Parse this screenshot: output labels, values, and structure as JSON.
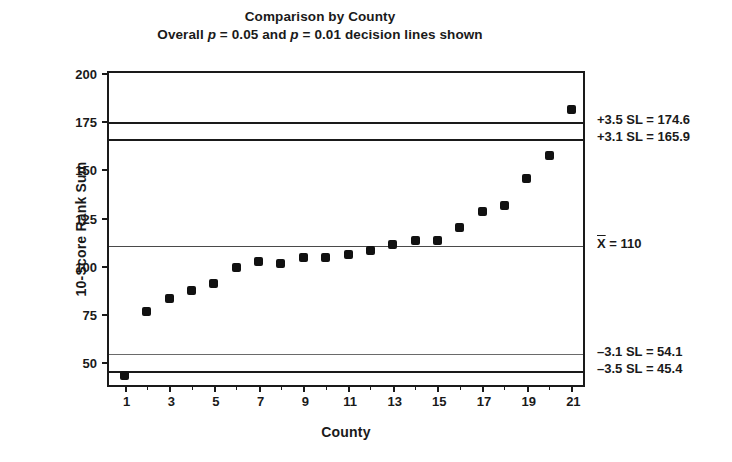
{
  "chart_data": {
    "type": "scatter",
    "title": "Comparison by County",
    "subtitle_parts": {
      "pre": "Overall ",
      "p1": "p",
      "mid1": " = 0.05 and ",
      "p2": "p",
      "mid2": " = 0.01 decision lines shown"
    },
    "subtitle": "Overall p = 0.05 and p = 0.01 decision lines shown",
    "xlabel": "County",
    "ylabel": "10-Score Rank Sum",
    "xlim": [
      0.3,
      21.7
    ],
    "ylim": [
      36,
      200
    ],
    "ylim_ticks": [
      50,
      75,
      100,
      125,
      150,
      175,
      200
    ],
    "ytick_labels": [
      "50",
      "75",
      "100",
      "125",
      "150",
      "175",
      "200"
    ],
    "xticks": [
      1,
      3,
      5,
      7,
      9,
      11,
      13,
      15,
      17,
      19,
      21
    ],
    "xtick_labels": [
      "1",
      "3",
      "5",
      "7",
      "9",
      "11",
      "13",
      "15",
      "17",
      "19",
      "21"
    ],
    "xticks_minor": [
      2,
      4,
      6,
      8,
      10,
      12,
      14,
      16,
      18,
      20
    ],
    "grid": false,
    "legend": "none",
    "marker_color": "#111111",
    "categories": [
      1,
      2,
      3,
      4,
      5,
      6,
      7,
      8,
      9,
      10,
      11,
      12,
      13,
      14,
      15,
      16,
      17,
      18,
      19,
      20,
      21
    ],
    "values": [
      43,
      76,
      83,
      87,
      91,
      99,
      102,
      101,
      104,
      104,
      106,
      108,
      111,
      113,
      113,
      120,
      128,
      131,
      145,
      157,
      181
    ],
    "reference_lines": [
      {
        "id": "ucl-3-5",
        "label": "+3.5 SL = 174.6",
        "value": 174.6,
        "weight": "heavy",
        "color": "#1a1a1a"
      },
      {
        "id": "ucl-3-1",
        "label": "+3.1 SL = 165.9",
        "value": 165.9,
        "weight": "heavy",
        "color": "#1a1a1a"
      },
      {
        "id": "center",
        "label": "X = 110",
        "label_symbol": "X",
        "label_rest": " = 110",
        "value": 110,
        "weight": "center",
        "color": "#4a4a4a"
      },
      {
        "id": "lcl-3-1",
        "label": "–3.1 SL = 54.1",
        "value": 54.1,
        "weight": "light",
        "color": "#6a6a6a"
      },
      {
        "id": "lcl-3-5",
        "label": "–3.5 SL = 45.4",
        "value": 45.4,
        "weight": "heavy",
        "color": "#1a1a1a"
      }
    ],
    "annotations": [
      {
        "text": "+3.5 SL = 174.6"
      },
      {
        "text": "+3.1 SL = 165.9"
      },
      {
        "text": "X = 110"
      },
      {
        "text": "–3.1 SL = 54.1"
      },
      {
        "text": "–3.5 SL = 45.4"
      }
    ]
  }
}
